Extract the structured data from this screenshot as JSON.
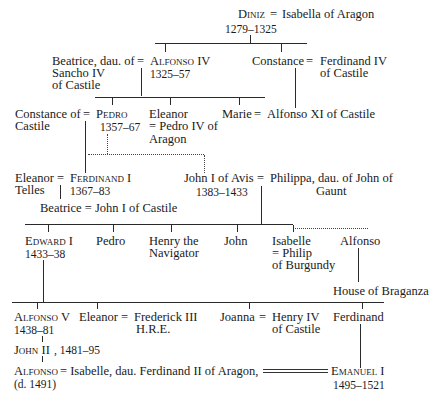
{
  "gen1": {
    "diniz": "Diniz",
    "eq": "=",
    "spouse": "Isabella of Aragon",
    "reign": "1279–1325"
  },
  "gen2": {
    "beatrice_1": "Beatrice, dau. of",
    "beatrice_2": "Sancho IV",
    "beatrice_3": "of Castile",
    "eq1": "=",
    "alfonso4": "Alfonso IV",
    "alfonso4_reign": "1325–57",
    "constance": "Constance",
    "eq2": "=",
    "ferd4_1": "Ferdinand IV",
    "ferd4_2": "of Castile"
  },
  "gen3": {
    "constance_1": "Constance of",
    "constance_2": "Castile",
    "eq1": "=",
    "pedro": "Pedro",
    "pedro_reign": "1357–67",
    "eleanor_1": "Eleanor",
    "eleanor_2": "= Pedro IV of",
    "eleanor_3": "Aragon",
    "marie": "Marie",
    "eq2": "=",
    "alfonso11": "Alfonso XI of Castile"
  },
  "gen4": {
    "eleanor": "Eleanor",
    "telles": "Telles",
    "eq1": "=",
    "ferdinand1": "Ferdinand I",
    "ferdinand1_reign": "1367–83",
    "beatrice": "Beatrice = John I of Castile",
    "john1": "John I of Avis",
    "eq2": "=",
    "philippa_1": "Philippa, dau. of John of",
    "philippa_2": "Gaunt",
    "john1_reign": "1383–1433"
  },
  "gen5": {
    "edward": "Edward I",
    "edward_reign": "1433–38",
    "pedro": "Pedro",
    "henry_1": "Henry the",
    "henry_2": "Navigator",
    "john": "John",
    "isabelle_1": "Isabelle",
    "isabelle_2": "= Philip",
    "isabelle_3": "of Burgundy",
    "alfonso": "Alfonso",
    "braganza": "House of Braganza"
  },
  "gen6": {
    "alfonso5": "Alfonso V",
    "alfonso5_reign": "1438–81",
    "eleanor": "Eleanor",
    "eq1": "=",
    "frederick_1": "Frederick III",
    "frederick_2": "H.R.E.",
    "joanna": "Joanna",
    "eq2": "=",
    "henry4_1": "Henry IV",
    "henry4_2": "of Castile",
    "ferdinand": "Ferdinand"
  },
  "gen7": {
    "john2": "John II",
    "john2_reign": ", 1481–95",
    "alfonso": "Alfonso",
    "alfonso_rest": " = Isabelle, dau. Ferdinand II of Aragon,",
    "alfonso_died": "(d. 1491)",
    "emanuel": "Emanuel I",
    "emanuel_reign": "1495–1521"
  }
}
